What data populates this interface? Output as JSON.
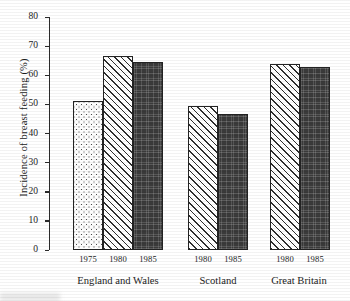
{
  "chart_data": {
    "type": "bar",
    "title": "",
    "xlabel": "",
    "ylabel": "Incidence of breast feeding (%)",
    "ylim": [
      0,
      80
    ],
    "ytick_step": 10,
    "yticks": [
      0,
      10,
      20,
      30,
      40,
      50,
      60,
      70,
      80
    ],
    "grid": false,
    "legend": "none",
    "groups": [
      "England and Wales",
      "Scotland",
      "Great Britain"
    ],
    "categories": [
      "1975",
      "1980",
      "1985"
    ],
    "series": [
      {
        "name": "1975",
        "pattern": "dotted",
        "values": [
          51.0,
          null,
          null
        ]
      },
      {
        "name": "1980",
        "pattern": "hatched",
        "values": [
          66.5,
          49.5,
          64.0
        ]
      },
      {
        "name": "1985",
        "pattern": "solid",
        "values": [
          64.5,
          46.8,
          62.8
        ]
      }
    ],
    "bars": [
      {
        "group": "England and Wales",
        "year": "1975",
        "value": 51.0,
        "pattern": "dotted"
      },
      {
        "group": "England and Wales",
        "year": "1980",
        "value": 66.5,
        "pattern": "hatched"
      },
      {
        "group": "England and Wales",
        "year": "1985",
        "value": 64.5,
        "pattern": "solid"
      },
      {
        "group": "Scotland",
        "year": "1980",
        "value": 49.5,
        "pattern": "hatched"
      },
      {
        "group": "Scotland",
        "year": "1985",
        "value": 46.8,
        "pattern": "solid"
      },
      {
        "group": "Great Britain",
        "year": "1980",
        "value": 64.0,
        "pattern": "hatched"
      },
      {
        "group": "Great Britain",
        "year": "1985",
        "value": 62.8,
        "pattern": "solid"
      }
    ]
  },
  "axis": {
    "tick_labels": [
      "80",
      "70",
      "60",
      "50",
      "40",
      "30",
      "20",
      "10",
      "0"
    ],
    "y_title": "Incidence of breast feeding (%)"
  },
  "x_axis": {
    "year_labels": [
      "1975",
      "1980",
      "1985",
      "1980",
      "1985",
      "1980",
      "1985"
    ],
    "group_labels": [
      "England and Wales",
      "Scotland",
      "Great Britain"
    ]
  },
  "colors": {
    "ink": "#1c1c1c",
    "axis": "#2b2b2b",
    "bar_outline": "#232323",
    "bar_solid": "#3a3a3a",
    "background": "#ffffff"
  }
}
